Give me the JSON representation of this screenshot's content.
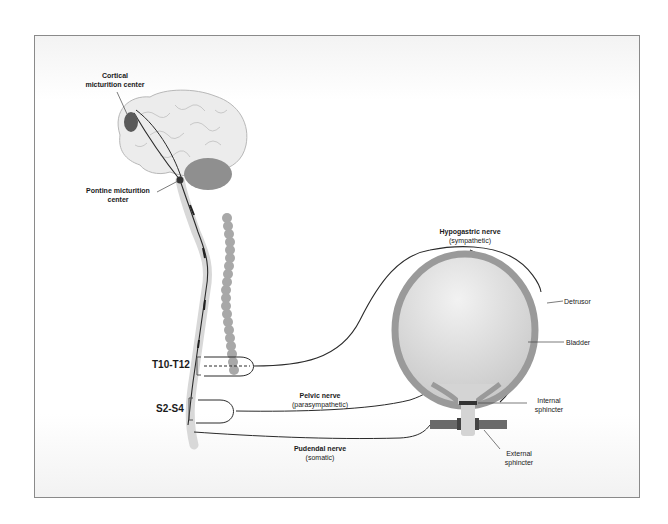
{
  "figure": {
    "colors": {
      "frame_border": "#8a8a8a",
      "brain_fill": "#ececec",
      "cerebellum_fill": "#8f8f8f",
      "center_fill": "#5a5a5a",
      "spinal_cord_fill": "#d8d8d8",
      "vertebra_fill": "#a8a8a8",
      "bladder_wall": "#9a9a9a",
      "bladder_fill": "#d9d9d9",
      "sphincter_fill": "#6a6a6a",
      "nerve_stroke": "#2a2a2a"
    }
  },
  "labels": {
    "cortical": {
      "line1": "Cortical",
      "line2": "micturition center"
    },
    "pontine": {
      "line1": "Pontine micturition",
      "line2": "center"
    },
    "hypogastric": {
      "line1": "Hypogastric nerve",
      "line2": "(sympathetic)"
    },
    "pelvic": {
      "line1": "Pelvic nerve",
      "line2": "(parasympathetic)"
    },
    "pudendal": {
      "line1": "Pudendal nerve",
      "line2": "(somatic)"
    },
    "detrusor": "Detrusor",
    "bladder": "Bladder",
    "internal_sphincter": {
      "line1": "Internal",
      "line2": "sphincter"
    },
    "external_sphincter": {
      "line1": "External",
      "line2": "sphincter"
    }
  },
  "segments": {
    "thoracic": "T10-T12",
    "sacral": "S2-S4"
  }
}
